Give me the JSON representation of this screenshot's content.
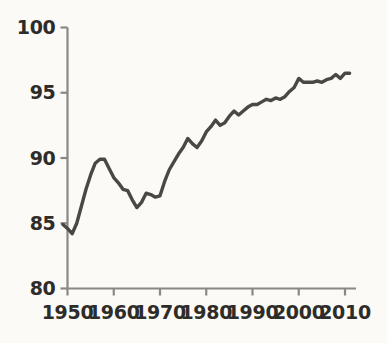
{
  "chart_data": {
    "type": "line",
    "title": "",
    "subtitle": "",
    "xlabel": "",
    "ylabel": "",
    "xlim": [
      1949,
      2011
    ],
    "ylim": [
      80,
      100
    ],
    "grid": false,
    "legend": null,
    "x_ticks": [
      1950,
      1960,
      1970,
      1980,
      1990,
      2000,
      2010
    ],
    "x_tick_labels": [
      "1950",
      "1960",
      "1970",
      "1980",
      "1990",
      "2000",
      "2010"
    ],
    "y_ticks": [
      80,
      85,
      90,
      95,
      100
    ],
    "y_tick_labels": [
      "80",
      "85",
      "90",
      "95",
      "100"
    ],
    "line_color": "#4a4843",
    "line_width": 3.4,
    "axis_color": "#8a8882",
    "text_color": "#2e2c28",
    "background_color": "#fbfaf7",
    "series": [
      {
        "name": "series-1",
        "x": [
          1949,
          1950,
          1951,
          1952,
          1953,
          1954,
          1955,
          1956,
          1957,
          1958,
          1959,
          1960,
          1961,
          1962,
          1963,
          1964,
          1965,
          1966,
          1967,
          1968,
          1969,
          1970,
          1971,
          1972,
          1973,
          1974,
          1975,
          1976,
          1977,
          1978,
          1979,
          1980,
          1981,
          1982,
          1983,
          1984,
          1985,
          1986,
          1987,
          1988,
          1989,
          1990,
          1991,
          1992,
          1993,
          1994,
          1995,
          1996,
          1997,
          1998,
          1999,
          2000,
          2001,
          2002,
          2003,
          2004,
          2005,
          2006,
          2007,
          2008,
          2009,
          2010,
          2011
        ],
        "y": [
          84.9,
          84.6,
          84.2,
          85.0,
          86.3,
          87.6,
          88.7,
          89.6,
          89.9,
          89.9,
          89.2,
          88.5,
          88.1,
          87.6,
          87.5,
          86.8,
          86.2,
          86.6,
          87.3,
          87.2,
          87.0,
          87.1,
          88.2,
          89.1,
          89.7,
          90.3,
          90.8,
          91.5,
          91.1,
          90.8,
          91.3,
          92.0,
          92.4,
          92.9,
          92.5,
          92.7,
          93.2,
          93.6,
          93.3,
          93.6,
          93.9,
          94.1,
          94.1,
          94.3,
          94.5,
          94.4,
          94.6,
          94.5,
          94.7,
          95.1,
          95.4,
          96.1,
          95.8,
          95.8,
          95.8,
          95.9,
          95.8,
          96.0,
          96.1,
          96.4,
          96.1,
          96.5,
          96.5
        ]
      }
    ]
  },
  "axes": {
    "y_axis_name": "y-axis",
    "x_axis_name": "x-axis"
  }
}
